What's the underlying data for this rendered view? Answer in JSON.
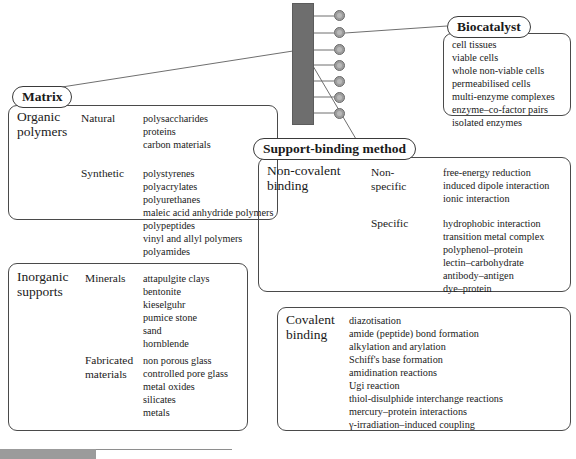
{
  "diagram": {
    "colors": {
      "support_bar": "#6e6e6e",
      "bead": "#9d9d9d",
      "outline": "#4a4a4a",
      "text": "#1a1a1a"
    },
    "central_graphic": {
      "name": "support-with-bound-enzymes",
      "bead_count": 7
    }
  },
  "biocatalyst": {
    "title": "Biocatalyst",
    "items": [
      "cell tissues",
      "viable cells",
      "whole non-viable cells",
      "permeabilised cells",
      "multi-enzyme complexes",
      "enzyme–co-factor pairs",
      "isolated enzymes"
    ]
  },
  "matrix": {
    "title": "Matrix",
    "organic": {
      "label_line1": "Organic",
      "label_line2": "polymers",
      "groups": [
        {
          "name": "Natural",
          "items": [
            "polysaccharides",
            "proteins",
            "carbon materials"
          ]
        },
        {
          "name": "Synthetic",
          "items": [
            "polystyrenes",
            "polyacrylates",
            "polyurethanes",
            "maleic acid anhydride polymers",
            "polypeptides",
            "vinyl and allyl polymers",
            "polyamides"
          ]
        }
      ]
    },
    "inorganic": {
      "label_line1": "Inorganic",
      "label_line2": "supports",
      "groups": [
        {
          "name": "Minerals",
          "name_line2": "",
          "items": [
            "attapulgite clays",
            "bentonite",
            "kieselguhr",
            "pumice stone",
            "sand",
            "hornblende"
          ]
        },
        {
          "name": "Fabricated",
          "name_line2": "materials",
          "items": [
            "non porous glass",
            "controlled pore glass",
            "metal oxides",
            "silicates",
            "metals"
          ]
        }
      ]
    }
  },
  "support_binding": {
    "title": "Support-binding method",
    "non_covalent": {
      "label_line1": "Non-covalent",
      "label_line2": "binding",
      "groups": [
        {
          "name": "Non-",
          "name_line2": "specific",
          "items": [
            "free-energy reduction",
            "induced dipole interaction",
            "ionic interaction"
          ]
        },
        {
          "name": "Specific",
          "name_line2": "",
          "items": [
            "hydrophobic interaction",
            "transition metal complex",
            "polyphenol–protein",
            "lectin–carbohydrate",
            "antibody–antigen",
            "dye–protein"
          ]
        }
      ]
    },
    "covalent": {
      "label_line1": "Covalent",
      "label_line2": "binding",
      "items": [
        "diazotisation",
        "amide (peptide) bond formation",
        "alkylation and arylation",
        "Schiff's base formation",
        "amidination reactions",
        "Ugi reaction",
        "thiol-disulphide interchange reactions",
        "mercury–protein interactions",
        "γ-irradiation–induced coupling"
      ]
    }
  }
}
